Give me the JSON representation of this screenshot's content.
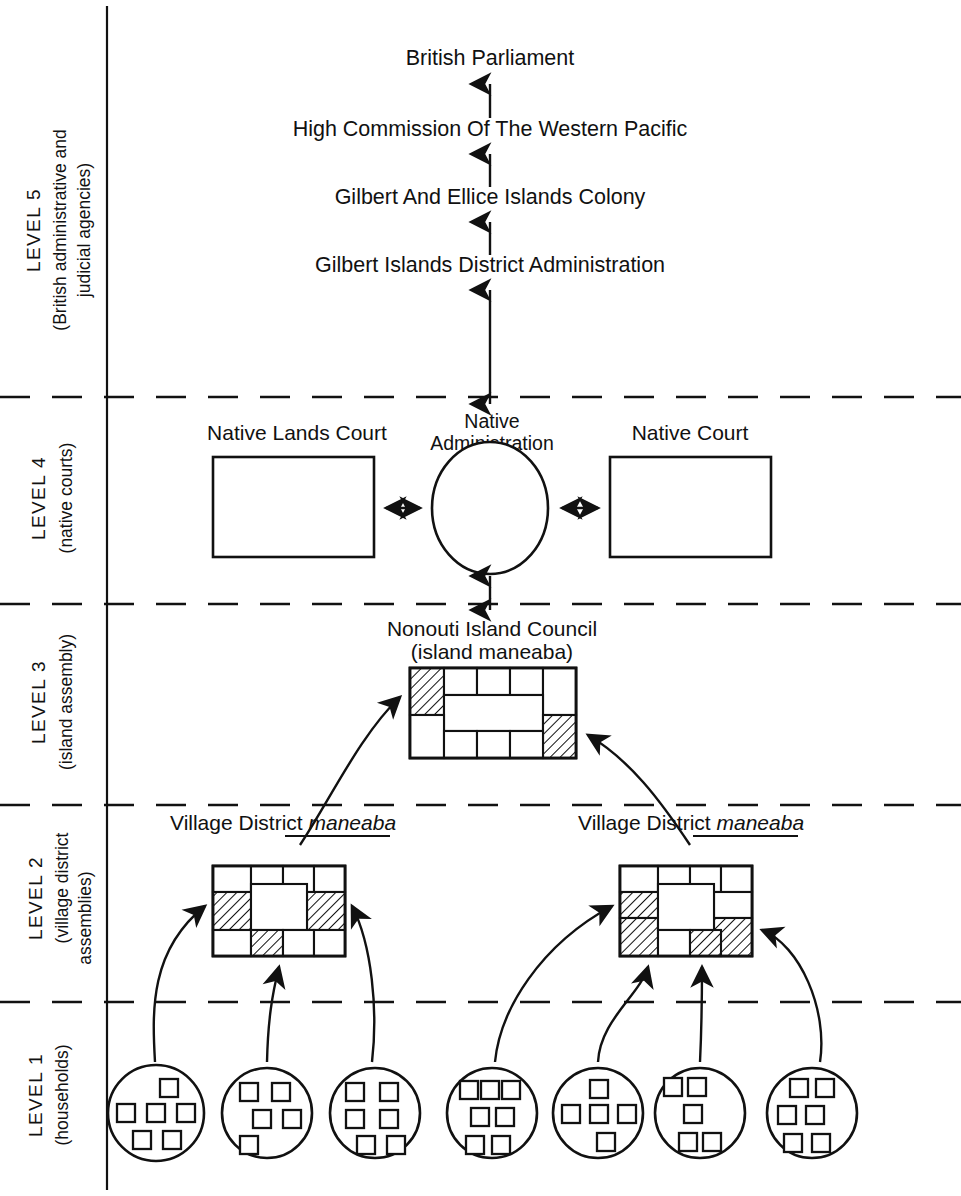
{
  "diagram": {
    "levels": [
      {
        "id": "level5",
        "number": "LEVEL 5",
        "subtitle_line1": "(British administrative and",
        "subtitle_line2": "judicial agencies)"
      },
      {
        "id": "level4",
        "number": "LEVEL 4",
        "subtitle_line1": "(native courts)",
        "subtitle_line2": ""
      },
      {
        "id": "level3",
        "number": "LEVEL 3",
        "subtitle_line1": "(island assembly)",
        "subtitle_line2": ""
      },
      {
        "id": "level2",
        "number": "LEVEL 2",
        "subtitle_line1": "(village district",
        "subtitle_line2": "assemblies)"
      },
      {
        "id": "level1",
        "number": "LEVEL 1",
        "subtitle_line1": "(households)",
        "subtitle_line2": ""
      }
    ],
    "level5_chain": [
      "British Parliament",
      "High Commission Of The Western Pacific",
      "Gilbert And Ellice Islands Colony",
      "Gilbert Islands District Administration"
    ],
    "level4": {
      "left_box_label": "Native Lands Court",
      "center_label_line1": "Native",
      "center_label_line2": "Administration",
      "right_box_label": "Native Court"
    },
    "level3": {
      "label_line1": "Nonouti Island Council",
      "label_line2": "(island maneaba)",
      "hatched_cell_count": 2
    },
    "level2": {
      "left_label_plain": "Village District ",
      "left_label_italic": "maneaba",
      "right_label_plain": "Village District ",
      "right_label_italic": "maneaba",
      "left_hatched_cell_count": 3,
      "right_hatched_cell_count": 5
    },
    "level1": {
      "household_group_count": 7,
      "household_counts": [
        6,
        4,
        6,
        7,
        5,
        5,
        6
      ]
    },
    "colors": {
      "ink": "#111111",
      "paper": "#ffffff"
    }
  }
}
